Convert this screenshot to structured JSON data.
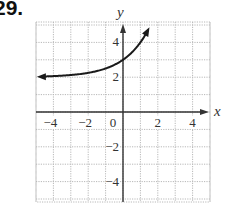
{
  "problem": {
    "number": "29."
  },
  "chart_data": {
    "type": "line",
    "title": "",
    "xlabel": "x",
    "ylabel": "y",
    "xlim": [
      -5,
      5
    ],
    "ylim": [
      -5.2,
      5.2
    ],
    "grid": true,
    "x_ticks": [
      -4,
      -2,
      0,
      2,
      4
    ],
    "y_ticks": [
      -4,
      -2,
      2,
      4
    ],
    "x_tick_labels": [
      "−4",
      "−2",
      "0",
      "2",
      "4"
    ],
    "y_tick_labels": [
      "−4",
      "−2",
      "2",
      "4"
    ],
    "series": [
      {
        "name": "y = 2^x + 2",
        "function": "2^x + 2",
        "horizontal_asymptote": 2,
        "y_intercept": 3,
        "x": [
          -5,
          -4,
          -3,
          -2,
          -1,
          0,
          0.5,
          1,
          1.45
        ],
        "values": [
          2.03,
          2.06,
          2.13,
          2.25,
          2.5,
          3,
          3.41,
          4,
          4.73
        ],
        "arrows": "both_ends"
      }
    ],
    "legend": null
  },
  "colors": {
    "grid": "#b8b8b8",
    "axis": "#333333",
    "curve": "#1a1a1a"
  }
}
